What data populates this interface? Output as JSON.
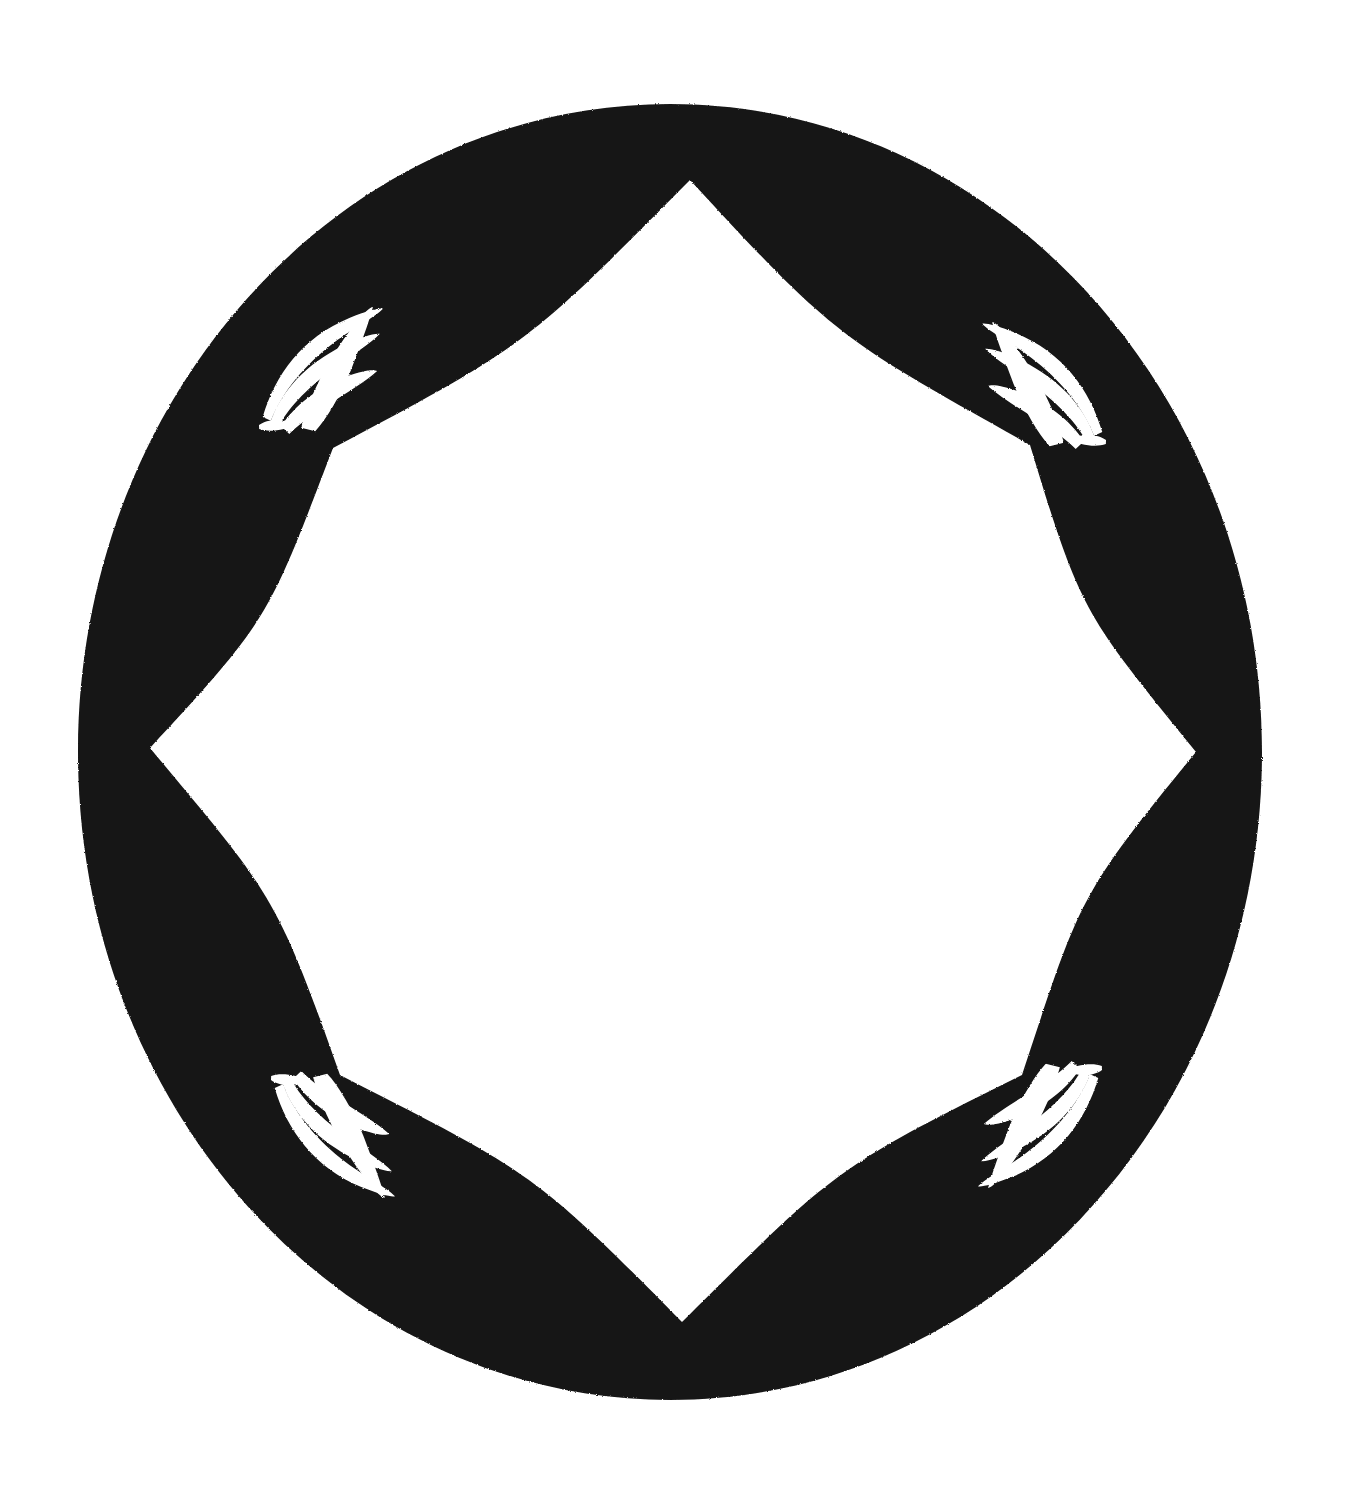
{
  "artwork": {
    "title": "Ornamental Quatrefoil Border Frame",
    "kind": "decorative-frame",
    "medium": "black ink on white paper, scanned",
    "canvas": {
      "width": 1351,
      "height": 1490
    },
    "colors": {
      "background": "#ffffff",
      "ink": "#141414",
      "ornament": "#ffffff"
    },
    "outer_ring": {
      "shape": "ellipse",
      "center_x": 670,
      "center_y": 752,
      "radius_x": 592,
      "radius_y": 648,
      "left": 78,
      "right": 1262,
      "top": 105,
      "bottom": 1400
    },
    "inner_opening": {
      "shape": "quatrefoil",
      "lobe_count": 4,
      "cusp_count": 4,
      "center_x": 676,
      "center_y": 750,
      "top_y": 180,
      "bottom_y": 1322,
      "left_x": 150,
      "right_x": 1196
    },
    "band_thickness": {
      "top": 75,
      "bottom": 78,
      "left": 70,
      "right": 67
    },
    "cusps": [
      {
        "name": "cusp-upper-left",
        "x": 333,
        "y": 448
      },
      {
        "name": "cusp-upper-right",
        "x": 1030,
        "y": 445
      },
      {
        "name": "cusp-lower-left",
        "x": 340,
        "y": 1075
      },
      {
        "name": "cusp-lower-right",
        "x": 1022,
        "y": 1075
      }
    ],
    "ornaments": [
      {
        "name": "ornament-top-left",
        "motif": "fan-plume",
        "stroke_count": 4,
        "position": "upper-left-diagonal",
        "orientation": "radiating up-right from lower-left node",
        "center_x": 318,
        "center_y": 367,
        "width": 135,
        "height": 120
      },
      {
        "name": "ornament-top-right",
        "motif": "fan-plume",
        "stroke_count": 4,
        "position": "upper-right-diagonal",
        "orientation": "radiating up-left from lower-right node (mirrored)",
        "center_x": 1047,
        "center_y": 382,
        "width": 135,
        "height": 120
      },
      {
        "name": "ornament-bottom-left",
        "motif": "fan-plume",
        "stroke_count": 4,
        "position": "lower-left-diagonal",
        "orientation": "radiating down-right from upper-left node (flipped)",
        "center_x": 330,
        "center_y": 1138,
        "width": 135,
        "height": 120
      },
      {
        "name": "ornament-bottom-right",
        "motif": "fan-plume",
        "stroke_count": 4,
        "position": "lower-right-diagonal",
        "orientation": "radiating down-left from upper-right node (flipped + mirrored)",
        "center_x": 1043,
        "center_y": 1128,
        "width": 135,
        "height": 120
      }
    ]
  }
}
